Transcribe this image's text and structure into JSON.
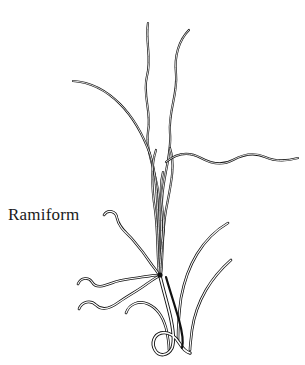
{
  "figure": {
    "label": "Ramiform",
    "label_position": {
      "x": 8,
      "y": 205
    },
    "canvas": {
      "width": 305,
      "height": 365
    },
    "background_color": "#ffffff",
    "ink_color": "#111111",
    "style": "black-and-white line drawing, double-outlined filaments",
    "node": {
      "x": 160,
      "y": 275,
      "description": "central convergence node where processes meet"
    },
    "parts": [
      {
        "name": "upper-filament-left-tall",
        "kind": "filament",
        "tip": {
          "x": 148,
          "y": 22
        },
        "path": "M148,23 C145,42 152,58 147,76 C142,95 152,112 148,132 C145,152 158,175 159,200 C160,228 158,255 160,272"
      },
      {
        "name": "upper-filament-right-tall",
        "kind": "filament",
        "tip": {
          "x": 189,
          "y": 29
        },
        "path": "M189,30 C179,40 174,56 176,74 C178,94 168,112 170,133 C172,154 163,176 162,200 C161,228 162,254 161,273"
      },
      {
        "name": "upper-left-sweep-filament",
        "kind": "filament",
        "tip": {
          "x": 73,
          "y": 81
        },
        "path": "M73,81 C90,82 106,90 120,104 C134,118 143,135 150,154 C156,172 157,196 158,218 C159,240 159,260 160,273"
      },
      {
        "name": "right-horizontal-wavy-filament",
        "kind": "filament",
        "tip": {
          "x": 298,
          "y": 159
        },
        "path": "M166,162 C178,152 190,152 201,158 C212,164 222,166 233,160 C244,154 254,152 265,157 C274,161 284,162 298,158"
      },
      {
        "name": "bundle-filament-a",
        "kind": "filament",
        "path": "M156,150 C150,168 152,190 155,210 C158,232 157,255 159,273"
      },
      {
        "name": "bundle-filament-b",
        "kind": "filament",
        "path": "M170,148 C176,166 170,188 166,210 C162,232 163,256 161,274"
      },
      {
        "name": "bundle-filament-c",
        "kind": "filament",
        "path": "M163,172 C157,194 166,214 163,236 C161,254 160,266 160,274"
      },
      {
        "name": "left-branch-upper-hooked",
        "kind": "branch",
        "tip": {
          "x": 104,
          "y": 212
        },
        "path": "M104,215 C108,209 116,211 117,218 C119,228 127,233 133,240 C140,248 146,256 152,265 C156,270 158,273 159,275"
      },
      {
        "name": "left-branch-mid-wavy",
        "kind": "branch",
        "tip": {
          "x": 78,
          "y": 281
        },
        "path": "M78,284 C81,277 89,277 92,282 C96,289 104,286 112,283 C122,279 132,279 142,277 C150,276 156,275 159,275"
      },
      {
        "name": "left-branch-lower-wavy",
        "kind": "branch",
        "tip": {
          "x": 79,
          "y": 307
        },
        "path": "M79,309 C82,301 91,300 96,305 C102,311 111,308 119,302 C129,295 139,290 148,283 C154,279 158,276 160,276"
      },
      {
        "name": "right-branch-upper-long",
        "kind": "branch",
        "tip": {
          "x": 228,
          "y": 222
        },
        "path": "M228,223 C216,230 205,241 197,254 C189,267 184,282 181,298 C179,313 178,328 178,340"
      },
      {
        "name": "right-branch-lower-short",
        "kind": "branch",
        "tip": {
          "x": 231,
          "y": 259
        },
        "path": "M231,260 C222,268 213,278 206,290 C199,302 194,316 192,330 C191,339 190,346 190,350"
      },
      {
        "name": "left-curl-branch",
        "kind": "branch",
        "tip": {
          "x": 126,
          "y": 311
        },
        "path": "M126,313 C129,304 139,300 148,304 C157,308 163,317 166,328 C168,337 169,345 169,350"
      },
      {
        "name": "main-trunk-hook",
        "kind": "trunk",
        "path": "M160,276 C163,289 167,302 170,315 C173,328 175,340 172,348 C168,356 159,357 155,350 C151,343 154,335 161,333 C169,331 176,337 180,344 C183,349 186,352 190,353"
      },
      {
        "name": "trunk-inner-line",
        "kind": "trunk-detail",
        "path": "M166,277 C170,291 175,306 179,320 C182,331 184,341 182,348"
      }
    ]
  }
}
